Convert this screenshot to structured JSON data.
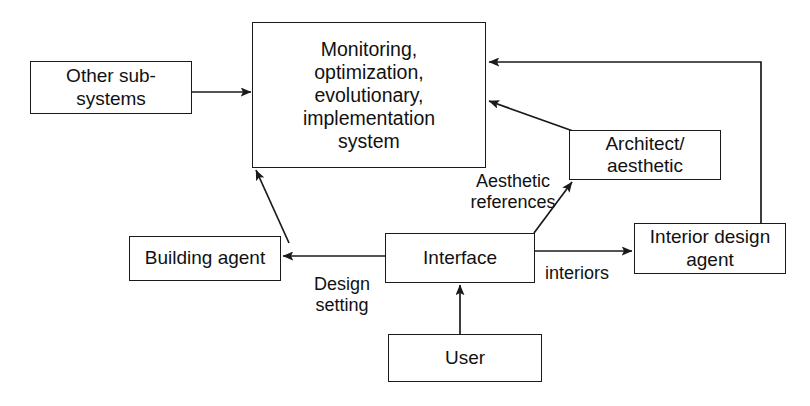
{
  "diagram": {
    "stroke_color": "#1a1a1a",
    "text_color": "#111111",
    "background_color": "#ffffff",
    "nodes": {
      "main_system": "Monitoring,\noptimization,\nevolutionary,\nimplementation\nsystem",
      "other_subsystems": "Other sub-\nsystems",
      "architect": "Architect/\naesthetic",
      "building_agent": "Building agent",
      "interface": "Interface",
      "interior_design_agent": "Interior design\nagent",
      "user": "User"
    },
    "edge_labels": {
      "aesthetic_references": "Aesthetic\nreferences",
      "design_setting": "Design\nsetting",
      "interiors": "interiors"
    },
    "edges": [
      {
        "from": "other_subsystems",
        "to": "main_system",
        "label": "",
        "style": "straight-horizontal"
      },
      {
        "from": "building_agent",
        "to": "main_system",
        "label": "",
        "style": "diagonal"
      },
      {
        "from": "architect",
        "to": "main_system",
        "label": "",
        "style": "diagonal"
      },
      {
        "from": "interior_design_agent",
        "to": "main_system",
        "label": "",
        "style": "orthogonal-feedback"
      },
      {
        "from": "interface",
        "to": "building_agent",
        "label": "Design setting",
        "style": "straight-horizontal"
      },
      {
        "from": "interface",
        "to": "interior_design_agent",
        "label": "interiors",
        "style": "straight-horizontal"
      },
      {
        "from": "interface",
        "to": "architect",
        "label": "Aesthetic references",
        "style": "diagonal"
      },
      {
        "from": "user",
        "to": "interface",
        "label": "",
        "style": "straight-vertical"
      }
    ]
  }
}
